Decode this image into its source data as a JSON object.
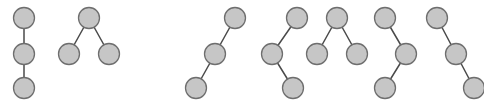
{
  "figure": {
    "title": "",
    "caption": "",
    "width": 484,
    "height": 104,
    "background_color": "#ffffff"
  },
  "style": {
    "node_fill": "#c6c6c6",
    "node_stroke": "#6e6e6e",
    "node_stroke_width": 1.3,
    "node_radius": 10.5,
    "edge_color": "#4a4a4a",
    "edge_width": 1.5,
    "node_label": ""
  },
  "chart_data": {
    "type": "diagram",
    "subtype": "node-link-graphs",
    "title": "",
    "xlabel": "",
    "ylabel": "",
    "grid": false,
    "legend": null,
    "node_count_per_graph": 3,
    "edge_count_per_graph": 2,
    "graphs": [
      {
        "id": "graph-1",
        "shape_name": "vertical-path",
        "nodes": [
          {
            "id": "g1n1",
            "x": 24,
            "y": 18
          },
          {
            "id": "g1n2",
            "x": 24,
            "y": 54
          },
          {
            "id": "g1n3",
            "x": 24,
            "y": 88
          }
        ],
        "edges": [
          {
            "source": "g1n1",
            "target": "g1n2"
          },
          {
            "source": "g1n2",
            "target": "g1n3"
          }
        ]
      },
      {
        "id": "graph-2",
        "shape_name": "v-shape-star",
        "nodes": [
          {
            "id": "g2n1",
            "x": 89,
            "y": 18
          },
          {
            "id": "g2n2",
            "x": 69,
            "y": 54
          },
          {
            "id": "g2n3",
            "x": 109,
            "y": 54
          }
        ],
        "edges": [
          {
            "source": "g2n1",
            "target": "g2n2"
          },
          {
            "source": "g2n1",
            "target": "g2n3"
          }
        ]
      },
      {
        "id": "graph-3",
        "shape_name": "diagonal-path-down-left",
        "nodes": [
          {
            "id": "g3n1",
            "x": 235,
            "y": 18
          },
          {
            "id": "g3n2",
            "x": 215,
            "y": 54
          },
          {
            "id": "g3n3",
            "x": 196,
            "y": 88
          }
        ],
        "edges": [
          {
            "source": "g3n1",
            "target": "g3n2"
          },
          {
            "source": "g3n2",
            "target": "g3n3"
          }
        ]
      },
      {
        "id": "graph-4",
        "shape_name": "zigzag-right-left-right",
        "nodes": [
          {
            "id": "g4n1",
            "x": 297,
            "y": 18
          },
          {
            "id": "g4n2",
            "x": 272,
            "y": 54
          },
          {
            "id": "g4n3",
            "x": 293,
            "y": 88
          }
        ],
        "edges": [
          {
            "source": "g4n1",
            "target": "g4n2"
          },
          {
            "source": "g4n2",
            "target": "g4n3"
          }
        ]
      },
      {
        "id": "graph-5",
        "shape_name": "v-shape-star",
        "nodes": [
          {
            "id": "g5n1",
            "x": 337,
            "y": 18
          },
          {
            "id": "g5n2",
            "x": 317,
            "y": 54
          },
          {
            "id": "g5n3",
            "x": 357,
            "y": 54
          }
        ],
        "edges": [
          {
            "source": "g5n1",
            "target": "g5n2"
          },
          {
            "source": "g5n1",
            "target": "g5n3"
          }
        ]
      },
      {
        "id": "graph-6",
        "shape_name": "zigzag-left-right-left",
        "nodes": [
          {
            "id": "g6n1",
            "x": 385,
            "y": 18
          },
          {
            "id": "g6n2",
            "x": 406,
            "y": 54
          },
          {
            "id": "g6n3",
            "x": 385,
            "y": 88
          }
        ],
        "edges": [
          {
            "source": "g6n1",
            "target": "g6n2"
          },
          {
            "source": "g6n2",
            "target": "g6n3"
          }
        ]
      },
      {
        "id": "graph-7",
        "shape_name": "diagonal-path-down-right",
        "nodes": [
          {
            "id": "g7n1",
            "x": 437,
            "y": 18
          },
          {
            "id": "g7n2",
            "x": 456,
            "y": 54
          },
          {
            "id": "g7n3",
            "x": 474,
            "y": 88
          }
        ],
        "edges": [
          {
            "source": "g7n1",
            "target": "g7n2"
          },
          {
            "source": "g7n2",
            "target": "g7n3"
          }
        ]
      }
    ]
  }
}
